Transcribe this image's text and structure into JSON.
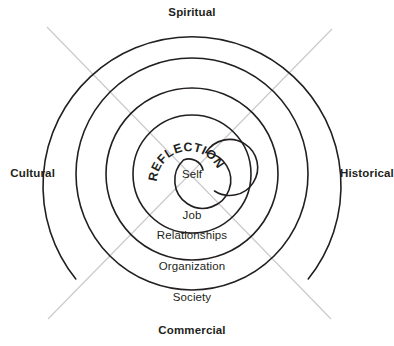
{
  "diagram": {
    "type": "concentric-circles",
    "center": {
      "x": 192,
      "y": 174
    },
    "colors": {
      "ring_stroke": "#231f20",
      "axis_line": "#c9c9cb",
      "text": "#231f20",
      "background": "#ffffff"
    },
    "center_label": "Self",
    "curved_label": "REFLECTION",
    "curved_label_chars": [
      "R",
      "E",
      "F",
      "L",
      "E",
      "C",
      "T",
      "I",
      "O",
      "N"
    ],
    "rings": [
      {
        "label": "Job",
        "radius": 59,
        "label_y": 219
      },
      {
        "label": "Relationships",
        "radius": 86,
        "label_y": 239
      },
      {
        "label": "Organization",
        "radius": 116,
        "label_y": 270
      },
      {
        "label": "Society",
        "radius": 149,
        "label_y": 301
      }
    ],
    "quadrant_labels": [
      {
        "name": "spiritual",
        "label": "Spiritual",
        "position": "top",
        "x": 192,
        "y": 16
      },
      {
        "name": "historical",
        "label": "Historical",
        "position": "right",
        "x": 353,
        "y": 177
      },
      {
        "name": "commercial",
        "label": "Commercial",
        "position": "bottom",
        "x": 192,
        "y": 334
      },
      {
        "name": "cultural",
        "label": "Cultural",
        "position": "left",
        "x": 32,
        "y": 177
      }
    ],
    "axis_lines": [
      {
        "name": "diagonal-nw-se",
        "x1": 47,
        "y1": 27,
        "x2": 331,
        "y2": 319
      },
      {
        "name": "diagonal-ne-sw",
        "x1": 332,
        "y1": 29,
        "x2": 48,
        "y2": 319
      }
    ]
  }
}
